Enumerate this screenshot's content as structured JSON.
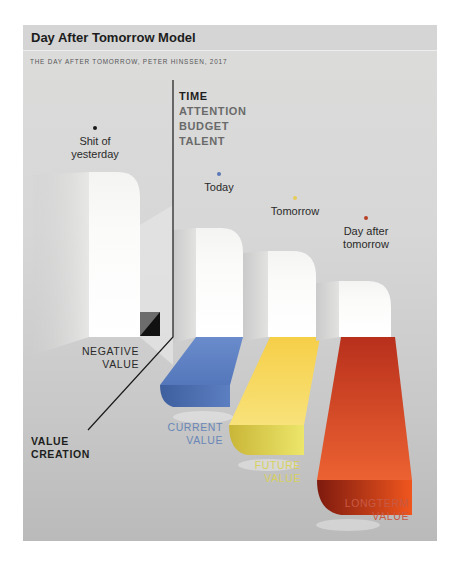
{
  "header": {
    "title": "Day After Tomorrow Model",
    "subtitle": "THE DAY AFTER TOMORROW, PETER HINSSEN, 2017"
  },
  "resources": {
    "items": [
      "TIME",
      "ATTENTION",
      "BUDGET",
      "TALENT"
    ]
  },
  "axis": {
    "label_line1": "VALUE",
    "label_line2": "CREATION"
  },
  "stages": [
    {
      "name_line1": "Shit of",
      "name_line2": "yesterday",
      "dot_color": "#1a1a1a",
      "value_line1": "NEGATIVE",
      "value_line2": "VALUE",
      "value_color": "#2a2a2a"
    },
    {
      "name_line1": "Today",
      "name_line2": "",
      "dot_color": "#5a78b8",
      "value_line1": "CURRENT",
      "value_line2": "VALUE",
      "value_color": "#6a86b8"
    },
    {
      "name_line1": "Tomorrow",
      "name_line2": "",
      "dot_color": "#e8cc5a",
      "value_line1": "FUTURE",
      "value_line2": "VALUE",
      "value_color": "#d8d060"
    },
    {
      "name_line1": "Day after",
      "name_line2": "tomorrow",
      "dot_color": "#b8402a",
      "value_line1": "LONGTERM",
      "value_line2": "VALUE",
      "value_color": "#c85a44"
    }
  ],
  "colors": {
    "current": "#4e72b4",
    "future": "#f2d650",
    "longterm": "#d44a22",
    "negative": "#1a1a1a"
  }
}
